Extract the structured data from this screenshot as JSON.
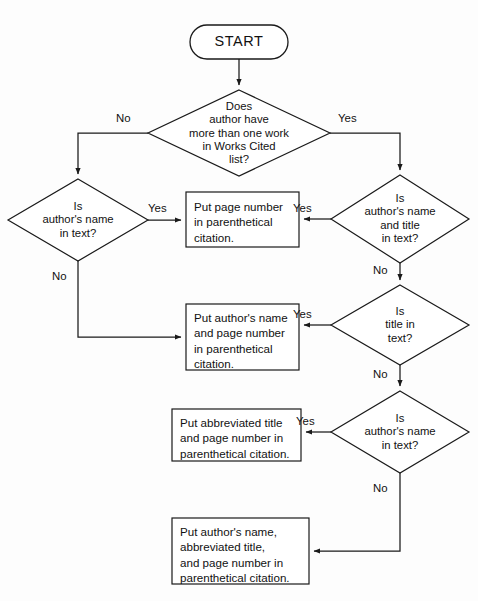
{
  "diagram": {
    "type": "flowchart",
    "stroke_color": "#1a1a1a",
    "fill_color": "#ffffff",
    "background_color": "#fdfdfd"
  },
  "nodes": {
    "start": {
      "shape": "terminator",
      "label": "START"
    },
    "d1": {
      "shape": "decision",
      "label": "Does\nauthor have\nmore than one work\nin Works Cited\nlist?"
    },
    "d2": {
      "shape": "decision",
      "label": "Is\nauthor's name\nin text?"
    },
    "d3": {
      "shape": "decision",
      "label": "Is\nauthor's name\nand title\nin text?"
    },
    "d4": {
      "shape": "decision",
      "label": "Is\ntitle in\ntext?"
    },
    "d5": {
      "shape": "decision",
      "label": "Is\nauthor's name\nin text?"
    },
    "p1": {
      "shape": "process",
      "label": "Put page number\nin parenthetical\ncitation."
    },
    "p2": {
      "shape": "process",
      "label": "Put author's name\nand page number\nin parenthetical\ncitation."
    },
    "p3": {
      "shape": "process",
      "label": "Put abbreviated title\nand page number in\nparenthetical citation."
    },
    "p4": {
      "shape": "process",
      "label": "Put author's name,\nabbreviated title,\nand page number in\nparenthetical citation."
    }
  },
  "edge_labels": {
    "d1_no": "No",
    "d1_yes": "Yes",
    "d2_yes": "Yes",
    "d2_no": "No",
    "d3_yes": "Yes",
    "d3_no": "No",
    "d4_yes": "Yes",
    "d4_no": "No",
    "d5_yes": "Yes",
    "d5_no": "No"
  }
}
